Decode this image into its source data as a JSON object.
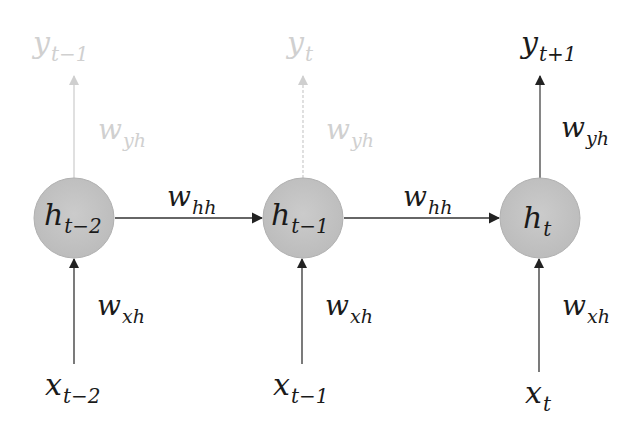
{
  "diagram": {
    "colors": {
      "node_fill": "#c4c4c4",
      "line": "#333333",
      "faded_line": "#cfcfcf",
      "text": "#1a1a1a",
      "faded_text": "#d0d0d0"
    },
    "nodes": [
      {
        "id": "h_t-2",
        "base": "h",
        "sub": "t−2"
      },
      {
        "id": "h_t-1",
        "base": "h",
        "sub": "t−1"
      },
      {
        "id": "h_t",
        "base": "h",
        "sub": "t"
      }
    ],
    "inputs": [
      {
        "base": "x",
        "sub": "t−2"
      },
      {
        "base": "x",
        "sub": "t−1"
      },
      {
        "base": "x",
        "sub": "t"
      }
    ],
    "outputs": [
      {
        "base": "y",
        "sub": "t−1",
        "faded": true
      },
      {
        "base": "y",
        "sub": "t",
        "faded": true
      },
      {
        "base": "y",
        "sub": "t+1",
        "faded": false
      }
    ],
    "weights": {
      "input_to_hidden": {
        "base": "w",
        "sub": "xh"
      },
      "hidden_to_hidden": {
        "base": "w",
        "sub": "hh"
      },
      "hidden_to_output": {
        "base": "w",
        "sub": "yh"
      }
    }
  }
}
